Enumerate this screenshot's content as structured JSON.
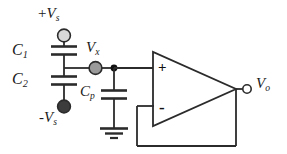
{
  "diagram": {
    "canvas": {
      "width": 287,
      "height": 154
    },
    "colors": {
      "wire": "#2b2b2b",
      "background": "#ffffff",
      "terminal_positive_fill": "#d8d8d8",
      "terminal_negative_fill": "#3c3c3c",
      "node_vx_fill": "#9a9a9a",
      "junction_fill": "#111111",
      "output_terminal_fill": "#ffffff",
      "text": "#1a1a1a"
    }
  },
  "labels": {
    "supply_positive": {
      "prefix": "+",
      "symbol": "V",
      "subscript": "s"
    },
    "supply_negative": {
      "prefix": "-",
      "symbol": "V",
      "subscript": "s"
    },
    "cap_c1": {
      "symbol": "C",
      "subscript": "1"
    },
    "cap_c2": {
      "symbol": "C",
      "subscript": "2"
    },
    "cap_cp": {
      "symbol": "C",
      "subscript": "p"
    },
    "node_vx": {
      "symbol": "V",
      "subscript": "x"
    },
    "output_vo": {
      "symbol": "V",
      "subscript": "o"
    },
    "opamp_noninverting": "+",
    "opamp_inverting": "-"
  },
  "components": [
    {
      "name": "capacitor-c1",
      "type": "capacitor",
      "label": "C1",
      "between": [
        "+Vs",
        "Vx node"
      ]
    },
    {
      "name": "capacitor-c2",
      "type": "capacitor",
      "label": "C2",
      "between": [
        "Vx node",
        "-Vs"
      ]
    },
    {
      "name": "capacitor-cp",
      "type": "capacitor",
      "label": "Cp",
      "between": [
        "Vx node",
        "ground"
      ]
    },
    {
      "name": "opamp",
      "type": "operational-amplifier",
      "configuration": "voltage follower",
      "inputs": [
        "+",
        "-"
      ],
      "output": "Vo"
    },
    {
      "name": "ground",
      "type": "ground-symbol",
      "bars": 3
    },
    {
      "name": "terminal-supply-positive",
      "type": "terminal",
      "fill": "light"
    },
    {
      "name": "terminal-supply-negative",
      "type": "terminal",
      "fill": "dark"
    },
    {
      "name": "terminal-output",
      "type": "terminal",
      "fill": "open"
    },
    {
      "name": "node-vx",
      "type": "node-marker",
      "fill": "gray"
    },
    {
      "name": "junction-dot",
      "type": "junction",
      "fill": "black"
    },
    {
      "name": "feedback-wire",
      "type": "wire",
      "from": "output",
      "to": "inverting input"
    }
  ]
}
